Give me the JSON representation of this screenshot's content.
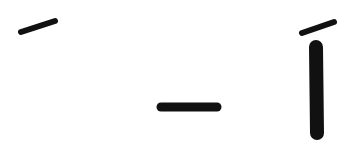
{
  "canvas": {
    "width": 355,
    "height": 166,
    "background": "#ffffff",
    "ink_color": "#111111"
  },
  "glyphs": [
    {
      "name": "acute-accent",
      "char": "´",
      "strokes": [
        {
          "x1": 21,
          "y1": 32,
          "x2": 55,
          "y2": 21,
          "width": 6
        }
      ]
    },
    {
      "name": "dash",
      "char": "–",
      "strokes": [
        {
          "x1": 161,
          "y1": 107,
          "x2": 217,
          "y2": 107,
          "width": 9
        }
      ]
    },
    {
      "name": "i-acute",
      "char": "í",
      "strokes": [
        {
          "x1": 302,
          "y1": 33,
          "x2": 334,
          "y2": 22,
          "width": 6
        },
        {
          "x1": 316,
          "y1": 47,
          "x2": 317,
          "y2": 133,
          "width": 14
        }
      ]
    }
  ]
}
